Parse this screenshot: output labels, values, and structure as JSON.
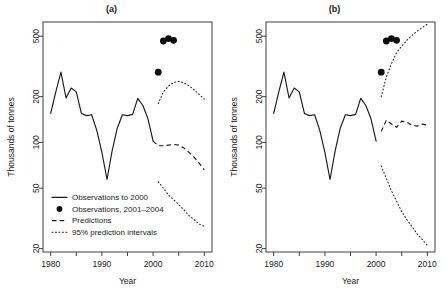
{
  "figure": {
    "width": 446,
    "height": 293,
    "background": "#ffffff",
    "ink": "#1a1a1a"
  },
  "axis": {
    "xlabel": "Year",
    "ylabel": "Thousands of tonnes",
    "y_ticks": [
      20,
      50,
      100,
      200,
      500
    ],
    "y_tick_labels": [
      "20",
      "50",
      "100",
      "200",
      "500"
    ],
    "x_ticks_major": [
      1980,
      1990,
      2000,
      2010
    ],
    "x_tick_labels": [
      "1980",
      "1990",
      "2000",
      "2010"
    ],
    "x_ticks_minor": [
      1985,
      1995,
      2005
    ],
    "yscale": "log",
    "ylim": [
      19,
      620
    ],
    "xlim": [
      1978.5,
      2011.5
    ],
    "grid": false
  },
  "legend": {
    "position": "bottom-left-panel-a",
    "items": [
      {
        "label": "Observations to 2000",
        "style": "solid-line"
      },
      {
        "label": "Observations, 2001–2004",
        "style": "filled-circle"
      },
      {
        "label": "Predictions",
        "style": "dashed-line"
      },
      {
        "label": "95% prediction intervals",
        "style": "dotted-line"
      }
    ]
  },
  "chart_data": [
    {
      "type": "line",
      "panel": "a",
      "title": "(a)",
      "xlabel": "Year",
      "ylabel": "Thousands of tonnes",
      "yscale": "log",
      "ylim": [
        19,
        620
      ],
      "xlim": [
        1978.5,
        2011.5
      ],
      "grid": false,
      "series": [
        {
          "name": "Observations to 2000",
          "style": "solid-line",
          "x": [
            1980,
            1981,
            1982,
            1983,
            1984,
            1985,
            1986,
            1987,
            1988,
            1989,
            1990,
            1991,
            1992,
            1993,
            1994,
            1995,
            1996,
            1997,
            1998,
            1999,
            2000
          ],
          "values": [
            155,
            215,
            290,
            196,
            228,
            215,
            155,
            150,
            152,
            120,
            86,
            57,
            88,
            124,
            152,
            150,
            153,
            195,
            175,
            143,
            102
          ]
        },
        {
          "name": "Observations, 2001–2004",
          "style": "filled-circle",
          "x": [
            2001,
            2002,
            2003,
            2004
          ],
          "values": [
            290,
            465,
            482,
            470
          ]
        },
        {
          "name": "Predictions",
          "style": "dashed-line",
          "x": [
            2000,
            2001,
            2002,
            2003,
            2004,
            2005,
            2006,
            2007,
            2008,
            2009,
            2010
          ],
          "values": [
            102,
            95,
            95,
            96,
            97,
            96,
            92,
            86,
            80,
            73,
            66
          ]
        },
        {
          "name": "95% prediction interval (upper)",
          "style": "dotted-line",
          "x": [
            2001,
            2002,
            2003,
            2004,
            2005,
            2006,
            2007,
            2008,
            2009,
            2010
          ],
          "values": [
            180,
            215,
            235,
            248,
            252,
            247,
            236,
            222,
            207,
            193
          ]
        },
        {
          "name": "95% prediction interval (lower)",
          "style": "dotted-line",
          "x": [
            2001,
            2002,
            2003,
            2004,
            2005,
            2006,
            2007,
            2008,
            2009,
            2010
          ],
          "values": [
            55,
            50,
            45,
            42,
            39,
            36,
            33,
            31,
            29,
            28
          ]
        }
      ]
    },
    {
      "type": "line",
      "panel": "b",
      "title": "(b)",
      "xlabel": "Year",
      "ylabel": "Thousands of tonnes",
      "yscale": "log",
      "ylim": [
        19,
        620
      ],
      "xlim": [
        1978.5,
        2011.5
      ],
      "grid": false,
      "series": [
        {
          "name": "Observations to 2000",
          "style": "solid-line",
          "x": [
            1980,
            1981,
            1982,
            1983,
            1984,
            1985,
            1986,
            1987,
            1988,
            1989,
            1990,
            1991,
            1992,
            1993,
            1994,
            1995,
            1996,
            1997,
            1998,
            1999,
            2000
          ],
          "values": [
            155,
            215,
            290,
            196,
            228,
            215,
            155,
            150,
            152,
            120,
            86,
            57,
            88,
            124,
            152,
            150,
            153,
            195,
            175,
            143,
            102
          ]
        },
        {
          "name": "Observations, 2001–2004",
          "style": "filled-circle",
          "x": [
            2001,
            2002,
            2003,
            2004
          ],
          "values": [
            290,
            465,
            482,
            470
          ]
        },
        {
          "name": "Predictions",
          "style": "dashed-line",
          "x": [
            2001,
            2002,
            2003,
            2004,
            2005,
            2006,
            2007,
            2008,
            2009,
            2010
          ],
          "values": [
            118,
            140,
            132,
            126,
            138,
            136,
            130,
            128,
            132,
            130
          ]
        },
        {
          "name": "95% prediction interval (upper)",
          "style": "dotted-line",
          "x": [
            2001,
            2002,
            2003,
            2004,
            2005,
            2006,
            2007,
            2008,
            2009,
            2010
          ],
          "values": [
            200,
            270,
            330,
            390,
            430,
            470,
            505,
            540,
            570,
            600
          ]
        },
        {
          "name": "95% prediction interval (lower)",
          "style": "dotted-line",
          "x": [
            2001,
            2002,
            2003,
            2004,
            2005,
            2006,
            2007,
            2008,
            2009,
            2010
          ],
          "values": [
            70,
            58,
            48,
            41,
            35,
            31,
            28,
            25,
            23,
            21
          ]
        }
      ]
    }
  ]
}
